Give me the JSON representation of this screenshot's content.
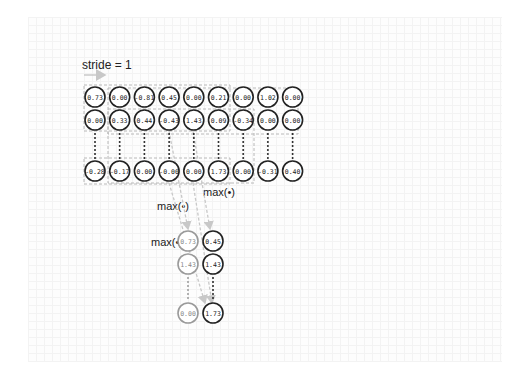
{
  "diagram": {
    "title": "stride = 1",
    "operation_labels": [
      "max(•)",
      "max(•)",
      "max(•)"
    ],
    "input": {
      "rows": [
        [
          "0.73",
          "0.00",
          "-0.81",
          "0.45",
          "0.00",
          "0.21",
          "0.00",
          "1.02",
          "0.00"
        ],
        [
          "0.00",
          "0.33",
          "0.44",
          "-0.43",
          "1.43",
          "0.09",
          "-0.34",
          "0.00",
          "0.00"
        ],
        [
          "-0.28",
          "-0.17",
          "0.00",
          "-0.00",
          "0.00",
          "1.73",
          "0.00",
          "-0.31",
          "0.40"
        ]
      ],
      "ellipsis_between_rows": [
        1,
        2
      ]
    },
    "output": {
      "rows": [
        [
          "0.73",
          "0.45"
        ],
        [
          "1.43",
          "1.43"
        ],
        [
          "0.00",
          "1.73"
        ]
      ],
      "ellipsis_between_rows": [
        1,
        2
      ],
      "faded_column": 0
    },
    "colors": {
      "circle_stroke": "#222222",
      "faded_stroke": "#9a9a9a",
      "dashed_window": "#b8b8b8",
      "arrow": "#c8c8c8",
      "text": "#222222"
    }
  }
}
